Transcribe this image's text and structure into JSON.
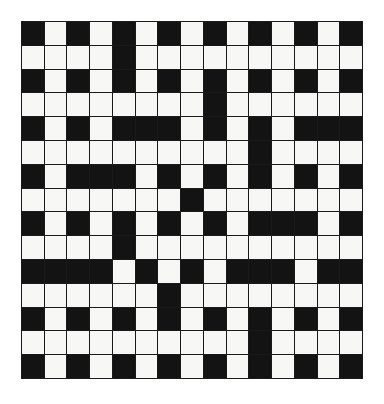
{
  "puzzle": {
    "title": "Crossword Grid",
    "type": "crossword-grid",
    "rows": 15,
    "columns": 15,
    "cell_size_px": 22.8,
    "grid_origin": {
      "x": 21,
      "y": 21
    },
    "grid_size_px": {
      "width": 342,
      "height": 358
    },
    "colors": {
      "background": "#ffffff",
      "white_cell": "#f7f7f5",
      "black_cell": "#131313",
      "grid_line": "#1a1a1a"
    },
    "legend": {
      "black": "blocked square",
      "white": "fillable letter square"
    },
    "black_square_count": 107,
    "white_square_count": 118,
    "grid": [
      [
        "B",
        "W",
        "B",
        "W",
        "B",
        "W",
        "B",
        "W",
        "B",
        "W",
        "B",
        "W",
        "B",
        "W",
        "B"
      ],
      [
        "W",
        "W",
        "W",
        "W",
        "B",
        "W",
        "W",
        "W",
        "W",
        "W",
        "W",
        "W",
        "W",
        "W",
        "W"
      ],
      [
        "B",
        "W",
        "B",
        "W",
        "B",
        "W",
        "B",
        "W",
        "B",
        "W",
        "B",
        "W",
        "B",
        "W",
        "B"
      ],
      [
        "W",
        "W",
        "W",
        "W",
        "W",
        "W",
        "W",
        "W",
        "B",
        "W",
        "W",
        "W",
        "W",
        "W",
        "W"
      ],
      [
        "B",
        "W",
        "B",
        "W",
        "B",
        "B",
        "B",
        "W",
        "B",
        "W",
        "B",
        "W",
        "B",
        "B",
        "B"
      ],
      [
        "W",
        "W",
        "W",
        "W",
        "W",
        "W",
        "W",
        "W",
        "W",
        "W",
        "B",
        "W",
        "W",
        "W",
        "W"
      ],
      [
        "B",
        "W",
        "B",
        "B",
        "B",
        "W",
        "B",
        "W",
        "B",
        "W",
        "B",
        "W",
        "B",
        "W",
        "B"
      ],
      [
        "W",
        "W",
        "W",
        "W",
        "W",
        "W",
        "W",
        "B",
        "W",
        "W",
        "W",
        "W",
        "W",
        "W",
        "W"
      ],
      [
        "B",
        "W",
        "B",
        "W",
        "B",
        "W",
        "B",
        "W",
        "B",
        "W",
        "B",
        "B",
        "B",
        "W",
        "B"
      ],
      [
        "W",
        "W",
        "W",
        "W",
        "B",
        "W",
        "W",
        "W",
        "W",
        "W",
        "W",
        "W",
        "W",
        "W",
        "W"
      ],
      [
        "B",
        "B",
        "B",
        "B",
        "W",
        "B",
        "W",
        "B",
        "W",
        "B",
        "B",
        "B",
        "W",
        "B",
        "B"
      ],
      [
        "W",
        "W",
        "W",
        "W",
        "W",
        "W",
        "B",
        "W",
        "W",
        "W",
        "W",
        "W",
        "W",
        "W",
        "W"
      ],
      [
        "B",
        "W",
        "B",
        "W",
        "B",
        "W",
        "B",
        "W",
        "B",
        "W",
        "B",
        "W",
        "B",
        "W",
        "B"
      ],
      [
        "W",
        "W",
        "W",
        "W",
        "W",
        "W",
        "W",
        "W",
        "W",
        "W",
        "B",
        "W",
        "W",
        "W",
        "W"
      ],
      [
        "B",
        "W",
        "B",
        "W",
        "B",
        "W",
        "B",
        "W",
        "B",
        "W",
        "B",
        "W",
        "B",
        "W",
        "B"
      ]
    ]
  }
}
